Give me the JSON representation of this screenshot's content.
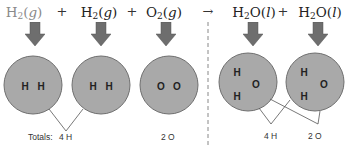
{
  "equation": {
    "reactants": [
      {
        "symbol": "H",
        "subscript": "2",
        "state": "g",
        "faded": true
      },
      {
        "symbol": "H",
        "subscript": "2",
        "state": "g",
        "faded": false
      },
      {
        "symbol": "O",
        "subscript": "2",
        "state": "g",
        "faded": false
      }
    ],
    "products": [
      {
        "formula_head": "H",
        "subscript": "2",
        "formula_tail": "O",
        "state": "l"
      },
      {
        "formula_head": "H",
        "subscript": "2",
        "formula_tail": "O",
        "state": "l"
      }
    ],
    "plus": "+",
    "yields": "→"
  },
  "molecules": [
    {
      "name": "hydrogen-molecule-1",
      "atoms": [
        "H",
        "H"
      ]
    },
    {
      "name": "hydrogen-molecule-2",
      "atoms": [
        "H",
        "H"
      ]
    },
    {
      "name": "oxygen-molecule",
      "atoms": [
        "O",
        "O"
      ]
    },
    {
      "name": "water-molecule-1",
      "atoms": [
        "H",
        "H",
        "O"
      ]
    },
    {
      "name": "water-molecule-2",
      "atoms": [
        "H",
        "H",
        "O"
      ]
    }
  ],
  "totals": {
    "reactants_prefix": "Totals:",
    "reactants_h": "4 H",
    "reactants_o": "2 O",
    "products_h": "4 H",
    "products_o": "2 O"
  },
  "colors": {
    "circle_fill": "#a9a9a9",
    "circle_stroke": "#6f6f6f",
    "arrow_fill": "#6e6e6e",
    "divider": "#888888",
    "faded_text": "#8a8a8a"
  }
}
